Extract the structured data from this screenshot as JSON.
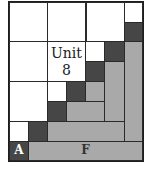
{
  "diagram": {
    "title_label": "Unit\n8",
    "label_a": "A",
    "label_f": "F",
    "colors": {
      "white": "#ffffff",
      "dark": "#464646",
      "gray": "#a9a9a9",
      "border": "#2a2a2a"
    },
    "grid": {
      "cols": 7,
      "rows": 8
    }
  }
}
